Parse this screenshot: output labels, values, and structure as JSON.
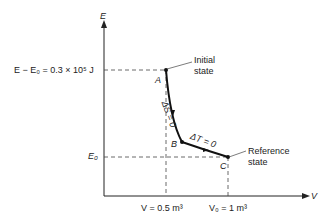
{
  "axes": {
    "y_label": "E",
    "x_label": "V"
  },
  "y_ticks": {
    "top": "E − E₀ = 0.3 × 10⁵ J",
    "bottom": "E₀"
  },
  "x_ticks": {
    "left": "V = 0.5 m³",
    "right": "V₀ = 1 m³"
  },
  "points": {
    "A": "A",
    "B": "B",
    "C": "C"
  },
  "annotations": {
    "initial_1": "Initial",
    "initial_2": "state",
    "reference_1": "Reference",
    "reference_2": "state",
    "entropy": "ΔS = 0",
    "temperature": "ΔT = 0"
  },
  "colors": {
    "line": "#222222"
  }
}
